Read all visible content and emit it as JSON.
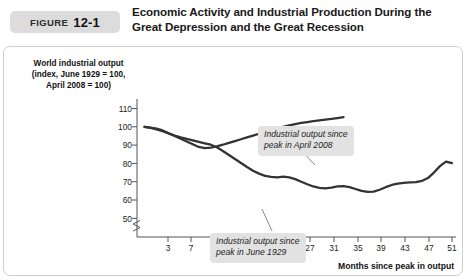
{
  "figure": {
    "badge_label": "FIGURE",
    "badge_number": "12-1",
    "title": "Economic Activity and Industrial Production During the Great Depression and the Great Recession"
  },
  "axes": {
    "y_caption": "World industrial output (index, June 1929 = 100, April 2008 = 100)",
    "y_caption_line1": "World industrial output",
    "y_caption_line2": "(index, June 1929 = 100,",
    "y_caption_line3": "April 2008 = 100)",
    "x_caption": "Months since peak in output",
    "y_ticks": [
      "110",
      "100",
      "90",
      "80",
      "70",
      "60",
      "50"
    ],
    "x_ticks": [
      "3",
      "7",
      "11",
      "15",
      "19",
      "23",
      "27",
      "31",
      "35",
      "39",
      "43",
      "47",
      "51"
    ],
    "axis_break": true
  },
  "annotations": {
    "callout_2008_line1": "Industrial output since",
    "callout_2008_line2": "peak in April 2008",
    "callout_1929_line1": "Industrial output since",
    "callout_1929_line2": "peak in June 1929"
  },
  "colors": {
    "line": "#333333",
    "badge_bg": "#dcdcdc",
    "callout_bg": "#e2e2e2",
    "panel_border": "#cfcfcf",
    "text": "#1a1a1a"
  },
  "chart_data": {
    "type": "line",
    "title": "Economic Activity and Industrial Production During the Great Depression and the Great Recession",
    "xlabel": "Months since peak in output",
    "ylabel": "World industrial output (index, June 1929 = 100, April 2008 = 100)",
    "xlim": [
      0,
      52
    ],
    "ylim": [
      50,
      112
    ],
    "grid": false,
    "legend": "annotations",
    "series": [
      {
        "name": "Industrial output since peak in April 2008",
        "x": [
          0,
          1,
          2,
          3,
          4,
          5,
          6,
          7,
          8,
          9,
          10,
          11,
          12,
          13,
          14,
          15,
          16,
          17,
          18,
          19,
          20,
          21,
          22,
          23,
          24,
          25,
          26,
          27,
          28,
          29,
          30,
          31,
          32,
          33
        ],
        "y": [
          100,
          99.6,
          99,
          98,
          96.5,
          95,
          93.5,
          92,
          90.5,
          89,
          88.3,
          88.6,
          89.3,
          90.2,
          91.2,
          92.2,
          93.2,
          94.2,
          95.2,
          96.2,
          97.2,
          98.2,
          99.2,
          100,
          100.8,
          101.5,
          102.1,
          102.6,
          103.1,
          103.5,
          103.9,
          104.3,
          104.8,
          105.3
        ]
      },
      {
        "name": "Industrial output since peak in June 1929",
        "x": [
          0,
          1,
          2,
          3,
          4,
          5,
          6,
          7,
          8,
          9,
          10,
          11,
          12,
          13,
          14,
          15,
          16,
          17,
          18,
          19,
          20,
          21,
          22,
          23,
          24,
          25,
          26,
          27,
          28,
          29,
          30,
          31,
          32,
          33,
          34,
          35,
          36,
          37,
          38,
          39,
          40,
          41,
          42,
          43,
          44,
          45,
          46,
          47,
          48,
          49,
          50,
          51
        ],
        "y": [
          100,
          99.4,
          98.6,
          97.6,
          96.4,
          95.2,
          94.2,
          93.4,
          92.6,
          91.8,
          91,
          90.2,
          88.8,
          86.8,
          84.6,
          82.4,
          80.2,
          78,
          76,
          74.4,
          73.2,
          72.6,
          72.4,
          72.8,
          72.4,
          71.4,
          70,
          68.6,
          67.4,
          66.6,
          66.4,
          66.8,
          67.4,
          67.6,
          67,
          66,
          65,
          64.4,
          64.6,
          65.6,
          67,
          68.2,
          69,
          69.4,
          69.6,
          69.8,
          70.4,
          72,
          75,
          78.5,
          81,
          80.2
        ]
      }
    ]
  }
}
